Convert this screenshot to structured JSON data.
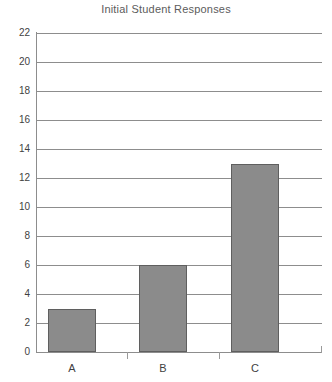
{
  "chart_data": {
    "type": "bar",
    "title": "Initial Student Responses",
    "xlabel": "",
    "ylabel": "",
    "categories": [
      "A",
      "B",
      "C"
    ],
    "values": [
      3,
      6,
      13
    ],
    "series": [
      {
        "name": "Initial Student Responses",
        "values": [
          3,
          6,
          13
        ]
      }
    ],
    "ylim": [
      0,
      22
    ],
    "ytick_step": 2,
    "ytick_labels": [
      "22",
      "20",
      "18",
      "16",
      "14",
      "12",
      "10",
      "8",
      "6",
      "4",
      "2",
      "0"
    ],
    "ytick_values": [
      22,
      20,
      18,
      16,
      14,
      12,
      10,
      8,
      6,
      4,
      2,
      0
    ],
    "grid": true,
    "grid_axis": "y",
    "legend": false,
    "legend_position": "none",
    "bar_color": "#8b8b8b",
    "bar_edge_color": "#5f5f5f",
    "axis_color": "#8d8d8d",
    "grid_color": "#8d8d8d",
    "text_color": "#3f3f3f",
    "title_color": "#5c5c5c",
    "background": "#ffffff"
  }
}
